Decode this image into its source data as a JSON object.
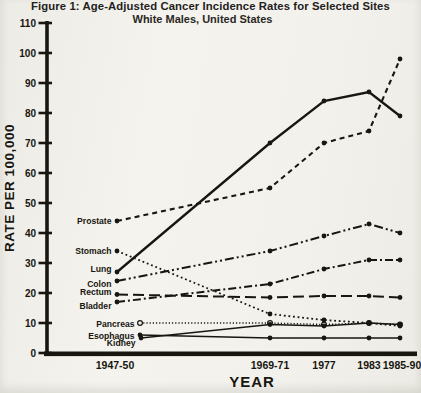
{
  "figure": {
    "title": "Figure 1: Age-Adjusted Cancer Incidence Rates for Selected Sites",
    "subtitle": "White Males, United States"
  },
  "chart_data": {
    "type": "line",
    "title": "Figure 1: Age-Adjusted Cancer Incidence Rates for Selected Sites",
    "subtitle": "White Males, United States",
    "xlabel": "YEAR",
    "ylabel": "RATE PER 100,000",
    "ylim": [
      0,
      110
    ],
    "ytick_step": 10,
    "grid": false,
    "legend_position": "direct-labels-left-of-first-point",
    "categories": [
      "1947-50",
      "1969-71",
      "1977",
      "1983",
      "1985-90"
    ],
    "series": [
      {
        "name": "Prostate",
        "line_style": "dashed",
        "marker": "filled-circle",
        "values": [
          44,
          55,
          70,
          74,
          98
        ]
      },
      {
        "name": "Stomach",
        "line_style": "dotted",
        "marker": "filled-circle",
        "values": [
          34,
          13,
          11,
          10,
          9
        ]
      },
      {
        "name": "Lung",
        "line_style": "solid",
        "marker": "filled-circle",
        "values": [
          27,
          70,
          84,
          87,
          79
        ]
      },
      {
        "name": "Colon",
        "line_style": "dash-dot-dot",
        "marker": "filled-circle",
        "values": [
          24,
          34,
          39,
          43,
          40
        ]
      },
      {
        "name": "Rectum",
        "line_style": "long-dash",
        "marker": "filled-circle",
        "values": [
          19.5,
          18.5,
          19,
          19,
          18.5
        ]
      },
      {
        "name": "Bladder",
        "line_style": "dash-dot",
        "marker": "filled-circle",
        "values": [
          17,
          23,
          28,
          31,
          31
        ]
      },
      {
        "name": "Pancreas",
        "line_style": "fine-dot",
        "marker": "open-circle",
        "values": [
          10,
          10,
          9.5,
          10,
          9.5
        ]
      },
      {
        "name": "Esophagus",
        "line_style": "solid-thin",
        "marker": "filled-circle",
        "values": [
          6,
          5,
          5,
          5,
          5
        ]
      },
      {
        "name": "Kidney",
        "line_style": "solid-thin",
        "marker": "filled-circle",
        "values": [
          5,
          9.5,
          9,
          10,
          9.5
        ]
      }
    ],
    "ink_color": "#18160f",
    "paper_color": "#f2f1ec",
    "layout_hints": {
      "x_tick_px": [
        115,
        270,
        324,
        369,
        400
      ],
      "y_of_zero_px": 353,
      "px_per_unit": 3,
      "axis_x_px": 47,
      "series_first_x_px": {
        "default": 117,
        "Pancreas": 140,
        "Esophagus": 140,
        "Kidney": 141
      },
      "series_label_dy_px": {
        "Prostate": 0,
        "Stomach": 0,
        "Lung": -3,
        "Colon": 3,
        "Rectum": -3,
        "Bladder": 4,
        "Pancreas": 1,
        "Esophagus": 1,
        "Kidney": 5
      },
      "series_line_width": {
        "Prostate": 2.1,
        "Stomach": 1.8,
        "Lung": 2.3,
        "Colon": 2.0,
        "Rectum": 2.0,
        "Bladder": 2.0,
        "Pancreas": 1.4,
        "Esophagus": 1.5,
        "Kidney": 1.5
      }
    }
  }
}
